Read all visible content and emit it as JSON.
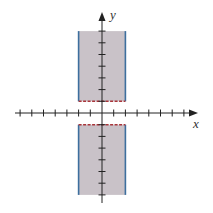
{
  "chart_data": {
    "type": "region",
    "title": "",
    "xlabel": "x",
    "ylabel": "y",
    "xlim": [
      -7.5,
      7.5
    ],
    "ylim": [
      -7.8,
      8.5
    ],
    "grid": false,
    "x_ticks": [
      -7,
      -6,
      -5,
      -4,
      -3,
      -2,
      -1,
      1,
      2,
      3,
      4,
      5,
      6,
      7
    ],
    "y_ticks": [
      -7,
      -6,
      -5,
      -4,
      -3,
      -2,
      -1,
      1,
      2,
      3,
      4,
      5,
      6,
      7
    ],
    "regions": [
      {
        "name": "upper-region",
        "x_range": [
          -2,
          2
        ],
        "y_range": [
          1,
          7
        ],
        "left_boundary": {
          "x": -2,
          "style": "solid"
        },
        "right_boundary": {
          "x": 2,
          "style": "solid"
        },
        "bottom_boundary": {
          "y": 1,
          "style": "dashed"
        }
      },
      {
        "name": "lower-region",
        "x_range": [
          -2,
          2
        ],
        "y_range": [
          -7,
          -1
        ],
        "left_boundary": {
          "x": -2,
          "style": "solid"
        },
        "right_boundary": {
          "x": 2,
          "style": "solid"
        },
        "top_boundary": {
          "y": -1,
          "style": "dashed"
        }
      }
    ]
  },
  "axes": {
    "x_label": "x",
    "y_label": "y"
  },
  "colors": {
    "fill": "#c9c2c8",
    "solid_boundary": "#3d6f9e",
    "dashed_boundary": "#a8353a",
    "axis": "#222222"
  },
  "layout": {
    "origin_px": [
      102,
      113
    ],
    "unit_px": 11.7
  }
}
